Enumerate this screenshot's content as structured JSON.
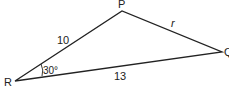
{
  "diagram": {
    "type": "triangle",
    "vertices": {
      "P": {
        "label": "P"
      },
      "Q": {
        "label": "Q"
      },
      "R": {
        "label": "R"
      }
    },
    "sides": {
      "RP": {
        "label": "10"
      },
      "PQ": {
        "label": "r"
      },
      "RQ": {
        "label": "13"
      }
    },
    "angles": {
      "R": {
        "label": "30°"
      }
    },
    "colors": {
      "stroke": "#222222",
      "background": "#ffffff"
    }
  }
}
